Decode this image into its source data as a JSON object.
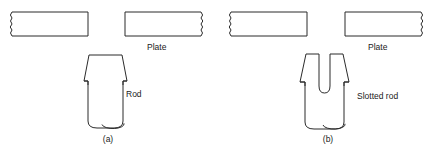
{
  "figure": {
    "background_color": "#ffffff",
    "line_color": "#2b2b2b",
    "text_color": "#1a1a1a",
    "width": 443,
    "height": 150,
    "panels": [
      {
        "id": "a",
        "caption": "(a)",
        "caption_x": 108,
        "caption_y": 142,
        "part_label": "Rod",
        "part_label_x": 126,
        "part_label_y": 97,
        "plate_label": "Plate",
        "plate_label_x": 147,
        "plate_label_y": 50,
        "plates": [
          {
            "name": "left-plate",
            "x": 10,
            "y": 12,
            "width": 78,
            "height": 24,
            "break_edge": "left"
          },
          {
            "name": "right-plate",
            "x": 125,
            "y": 12,
            "width": 78,
            "height": 24,
            "break_edge": "right"
          }
        ],
        "rod": {
          "name": "rod",
          "head_top_y": 55,
          "head_top_left_x": 89,
          "head_top_right_x": 122,
          "head_bottom_y": 82,
          "head_bottom_left_x": 84,
          "head_bottom_right_x": 127,
          "shaft_left_x": 88,
          "shaft_right_x": 123,
          "shaft_bottom_y": 128,
          "ellipse_cx": 113,
          "ellipse_cy": 124,
          "ellipse_rx": 11,
          "ellipse_ry": 4.5
        }
      },
      {
        "id": "b",
        "caption": "(b)",
        "caption_x": 328,
        "caption_y": 142,
        "part_label": "Slotted rod",
        "part_label_x": 357,
        "part_label_y": 99,
        "plate_label": "Plate",
        "plate_label_x": 368,
        "plate_label_y": 50,
        "plates": [
          {
            "name": "left-plate",
            "x": 229,
            "y": 12,
            "width": 78,
            "height": 24,
            "break_edge": "left"
          },
          {
            "name": "right-plate",
            "x": 345,
            "y": 12,
            "width": 78,
            "height": 24,
            "break_edge": "right"
          }
        ],
        "rod": {
          "name": "slotted-rod",
          "head_top_y": 54,
          "prong_left_top_left_x": 306,
          "prong_left_top_right_x": 319,
          "prong_right_top_left_x": 330,
          "prong_right_top_right_x": 343,
          "head_bottom_y": 83,
          "head_bottom_left_x": 300,
          "head_bottom_right_x": 349,
          "shaft_left_x": 305,
          "shaft_right_x": 344,
          "shaft_bottom_y": 129,
          "slot_left_x": 319,
          "slot_right_x": 330,
          "slot_bottom_y": 92,
          "ellipse_cx": 334,
          "ellipse_cy": 124,
          "ellipse_rx": 11,
          "ellipse_ry": 4.5
        }
      }
    ]
  }
}
